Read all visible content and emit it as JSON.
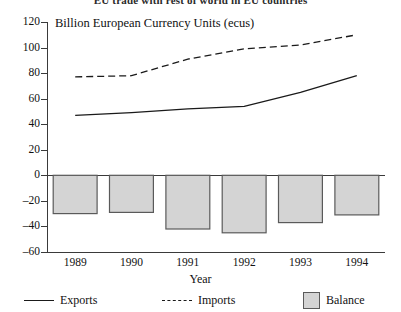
{
  "title_clipped": "EU trade with rest of world in EU countries",
  "chart_data": {
    "type": "line",
    "title": "",
    "xlabel": "Year",
    "ylabel": "Billion European Currency Units (ecus)",
    "categories": [
      "1989",
      "1990",
      "1991",
      "1992",
      "1993",
      "1994"
    ],
    "ylim": [
      -60,
      120
    ],
    "yticks": [
      -60,
      -40,
      -20,
      0,
      20,
      40,
      60,
      80,
      100,
      120
    ],
    "grid": false,
    "legend_position": "bottom",
    "series": [
      {
        "name": "Exports",
        "style": "solid-line",
        "values": [
          47,
          49,
          52,
          54,
          65,
          78
        ]
      },
      {
        "name": "Imports",
        "style": "dashed-line",
        "values": [
          77,
          78,
          91,
          99,
          102,
          110
        ]
      },
      {
        "name": "Balance",
        "style": "filled-bar",
        "color": "#d4d4d4",
        "values": [
          -30,
          -29,
          -42,
          -45,
          -37,
          -31
        ]
      }
    ]
  },
  "axis": {
    "y_title": "Billion European Currency Units (ecus)",
    "x_title": "Year"
  },
  "legend": {
    "items": [
      {
        "label": "Exports",
        "marker": "solid-line-icon"
      },
      {
        "label": "Imports",
        "marker": "dashed-line-icon"
      },
      {
        "label": "Balance",
        "marker": "gray-square-icon"
      }
    ]
  }
}
